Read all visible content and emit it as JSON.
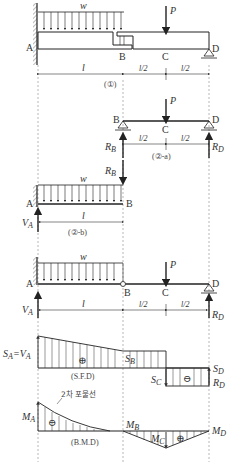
{
  "diagram": {
    "figure1": {
      "load_label": "w",
      "force_label": "P",
      "points": {
        "a": "A",
        "b": "B",
        "c": "C",
        "d": "D"
      },
      "dims": {
        "ab": "l",
        "bc": "l/2",
        "cd": "l/2"
      },
      "caption": "(①)"
    },
    "figure2a": {
      "force_label": "P",
      "points": {
        "b": "B",
        "c": "C",
        "d": "D"
      },
      "reactions": {
        "rb": "R",
        "rb_sub": "B",
        "rd": "R",
        "rd_sub": "D"
      },
      "dims": {
        "bc": "l/2",
        "cd": "l/2"
      },
      "caption": "(②-a)"
    },
    "figure2b": {
      "load_label": "w",
      "points": {
        "a": "A",
        "b": "B"
      },
      "reactions": {
        "rb": "R",
        "rb_sub": "B",
        "va": "V",
        "va_sub": "A"
      },
      "dims": {
        "ab": "l"
      },
      "caption": "(②-b)"
    },
    "figure3": {
      "load_label": "w",
      "force_label": "P",
      "points": {
        "a": "A",
        "b": "B",
        "c": "C",
        "d": "D"
      },
      "reactions": {
        "va": "V",
        "va_sub": "A",
        "rd": "R",
        "rd_sub": "D"
      },
      "dims": {
        "ab": "l",
        "bc": "l/2",
        "cd": "l/2"
      }
    },
    "sfd": {
      "sa_label": "S",
      "sa_sub": "A",
      "sa_eq": "=V",
      "sa_eq_sub": "A",
      "sb": "S",
      "sb_sub": "B",
      "sc": "S",
      "sc_sub": "C",
      "sd": "S",
      "sd_sub": "D",
      "rd": "R",
      "rd_sub": "D",
      "plus": "⊕",
      "minus": "⊖",
      "caption": "(S.F.D)"
    },
    "bmd": {
      "annotation": "2차 포물선",
      "ma": "M",
      "ma_sub": "A",
      "mb": "M",
      "mb_sub": "B",
      "mc": "M",
      "mc_sub": "C",
      "md": "M",
      "md_sub": "D",
      "plus": "⊕",
      "minus": "⊖",
      "caption": "(B.M.D)"
    }
  }
}
